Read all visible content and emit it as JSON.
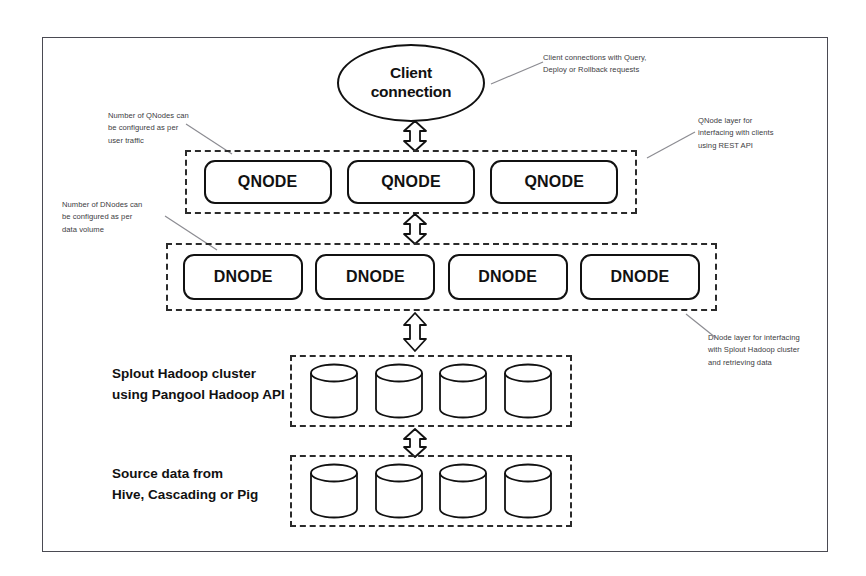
{
  "diagram": {
    "client": {
      "label_line1": "Client",
      "label_line2": "connection"
    },
    "qnode_layer": {
      "nodes": [
        {
          "label": "QNODE"
        },
        {
          "label": "QNODE"
        },
        {
          "label": "QNODE"
        }
      ]
    },
    "dnode_layer": {
      "nodes": [
        {
          "label": "DNODE"
        },
        {
          "label": "DNODE"
        },
        {
          "label": "DNODE"
        },
        {
          "label": "DNODE"
        }
      ]
    },
    "hadoop_layer": {
      "label_line1": "Splout Hadoop cluster",
      "label_line2": "using Pangool Hadoop API",
      "cylinders": [
        {
          "name": "database-cylinder"
        },
        {
          "name": "database-cylinder"
        },
        {
          "name": "database-cylinder"
        },
        {
          "name": "database-cylinder"
        }
      ]
    },
    "source_layer": {
      "label_line1": "Source data from",
      "label_line2": "Hive, Cascading or Pig",
      "cylinders": [
        {
          "name": "database-cylinder"
        },
        {
          "name": "database-cylinder"
        },
        {
          "name": "database-cylinder"
        },
        {
          "name": "database-cylinder"
        }
      ]
    },
    "annotations": {
      "client": {
        "line1": "Client connections with Query,",
        "line2": "Deploy or Rollback requests"
      },
      "qnode_left": {
        "line1": "Number of QNodes can",
        "line2": "be configured as per",
        "line3": "user traffic"
      },
      "qnode_right": {
        "line1": "QNode layer for",
        "line2": "interfacing with clients",
        "line3": "using REST API"
      },
      "dnode_left": {
        "line1": "Number of DNodes can",
        "line2": "be configured as per",
        "line3": "data volume"
      },
      "dnode_right": {
        "line1": "DNode layer for interfacing",
        "line2": "with Splout Hadoop cluster",
        "line3": "and  retrieving data"
      }
    },
    "connectors": [
      {
        "name": "client-to-qnode-arrow",
        "direction": "bidirectional"
      },
      {
        "name": "qnode-to-dnode-arrow",
        "direction": "bidirectional"
      },
      {
        "name": "dnode-to-hadoop-arrow",
        "direction": "bidirectional"
      },
      {
        "name": "hadoop-to-source-arrow",
        "direction": "bidirectional"
      }
    ],
    "colors": {
      "frame": "#4a4a52",
      "stroke": "#111111",
      "dashed": "#2b2b2b",
      "annotation_text": "#3c3c42",
      "background": "#ffffff"
    }
  }
}
